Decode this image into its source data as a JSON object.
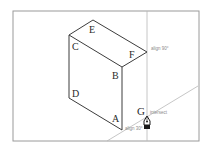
{
  "diagram": {
    "colors": {
      "frame": "#9a9a9a",
      "edge": "#3c3c3c",
      "guide": "#b8b8b8",
      "label": "#2a2a2a",
      "hint": "#8a8a8a"
    },
    "vertices": {
      "A": {
        "label": "A"
      },
      "B": {
        "label": "B"
      },
      "C": {
        "label": "C"
      },
      "D": {
        "label": "D"
      },
      "E": {
        "label": "E"
      },
      "F": {
        "label": "F"
      },
      "G": {
        "label": "G"
      }
    },
    "hints": {
      "align_90": "align 90°",
      "align_30": "align 30°",
      "intersect": "intersect"
    },
    "cursor": {
      "icon": "pen-tool-icon"
    }
  }
}
